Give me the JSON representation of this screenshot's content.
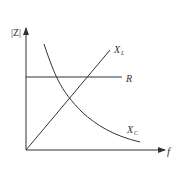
{
  "diagram": {
    "axes": {
      "x_label": "f",
      "y_label_bars": "|Z|",
      "y_label_letter": "Z"
    },
    "curves": [
      {
        "id": "R",
        "label": "R",
        "label_sub": "",
        "shape": "horizontal line",
        "description": "Resistance, constant with frequency"
      },
      {
        "id": "XL",
        "label": "X",
        "label_sub": "L",
        "shape": "straight line from origin",
        "description": "Inductive reactance, increases linearly with frequency"
      },
      {
        "id": "XC",
        "label": "X",
        "label_sub": "C",
        "shape": "hyperbola decreasing",
        "description": "Capacitive reactance, decreases with frequency"
      }
    ],
    "colors": {
      "line": "#333333",
      "background": "#ffffff"
    }
  }
}
